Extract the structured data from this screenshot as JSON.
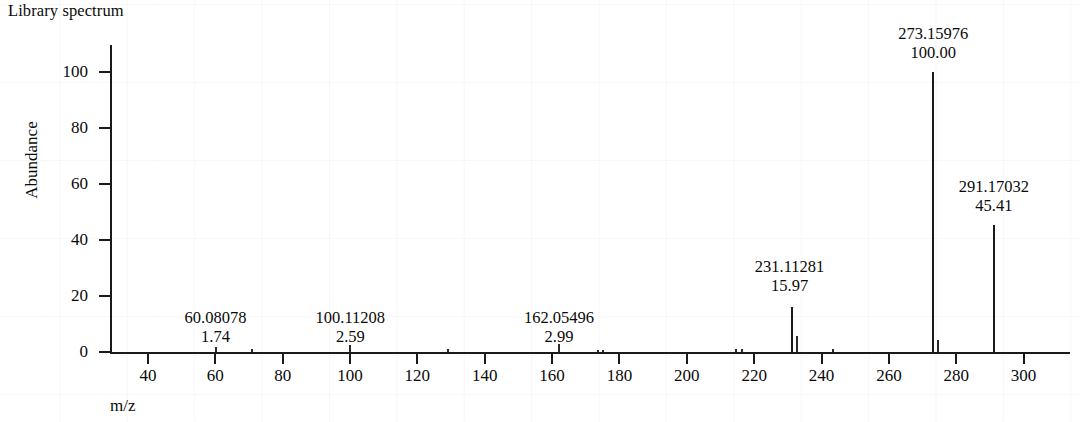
{
  "title": "Library spectrum",
  "axis_title_x": "m/z",
  "axis_title_y": "Abundance",
  "chart_data": {
    "type": "bar",
    "title": "Library spectrum",
    "subtitle": "",
    "xlabel": "m/z",
    "ylabel": "Abundance",
    "xlim": [
      30,
      315
    ],
    "ylim": [
      0,
      108
    ],
    "xticks": [
      40,
      60,
      80,
      100,
      120,
      140,
      160,
      180,
      200,
      220,
      240,
      260,
      280,
      300
    ],
    "yticks": [
      0,
      20,
      40,
      60,
      80,
      100
    ],
    "grid": false,
    "legend": "none",
    "labeled_peaks": [
      {
        "mz": "60.08078",
        "abundance": "1.74",
        "x": 60.08078,
        "y": 1.74
      },
      {
        "mz": "100.11208",
        "abundance": "2.59",
        "x": 100.11208,
        "y": 2.59
      },
      {
        "mz": "162.05496",
        "abundance": "2.99",
        "x": 162.05496,
        "y": 2.99
      },
      {
        "mz": "231.11281",
        "abundance": "15.97",
        "x": 231.11281,
        "y": 15.97
      },
      {
        "mz": "273.15976",
        "abundance": "100.00",
        "x": 273.15976,
        "y": 100.0
      },
      {
        "mz": "291.17032",
        "abundance": "45.41",
        "x": 291.17032,
        "y": 45.41
      }
    ],
    "unlabeled_peaks": [
      {
        "x": 60.08078,
        "y": 1.74
      },
      {
        "x": 71.0,
        "y": 0.9
      },
      {
        "x": 100.11208,
        "y": 2.59
      },
      {
        "x": 129.0,
        "y": 1.1
      },
      {
        "x": 162.05496,
        "y": 2.99
      },
      {
        "x": 173.5,
        "y": 0.8
      },
      {
        "x": 175.0,
        "y": 0.8
      },
      {
        "x": 214.5,
        "y": 1.0
      },
      {
        "x": 216.3,
        "y": 1.0
      },
      {
        "x": 231.11281,
        "y": 15.97
      },
      {
        "x": 232.6,
        "y": 5.6
      },
      {
        "x": 243.5,
        "y": 1.0
      },
      {
        "x": 273.15976,
        "y": 100.0
      },
      {
        "x": 274.6,
        "y": 4.2
      },
      {
        "x": 291.17032,
        "y": 45.41
      }
    ],
    "categories": [
      60.08078,
      100.11208,
      162.05496,
      231.11281,
      273.15976,
      291.17032
    ],
    "values": [
      1.74,
      2.59,
      2.99,
      15.97,
      100.0,
      45.41
    ]
  }
}
